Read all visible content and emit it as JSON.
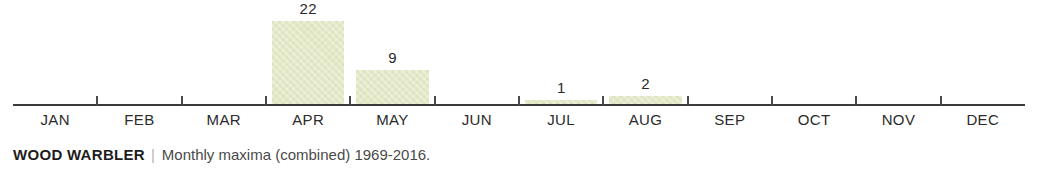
{
  "chart_data": {
    "type": "bar",
    "title": "WOOD WARBLER",
    "subtitle": "Monthly maxima (combined) 1969-2016.",
    "xlabel": "",
    "ylabel": "",
    "categories": [
      "JAN",
      "FEB",
      "MAR",
      "APR",
      "MAY",
      "JUN",
      "JUL",
      "AUG",
      "SEP",
      "OCT",
      "NOV",
      "DEC"
    ],
    "values": [
      0,
      0,
      0,
      22,
      9,
      0,
      1,
      2,
      0,
      0,
      0,
      0
    ],
    "value_labels": [
      "",
      "",
      "",
      "22",
      "9",
      "",
      "1",
      "2",
      "",
      "",
      "",
      ""
    ],
    "ylim": [
      0,
      22
    ],
    "grid": false,
    "legend": false,
    "bar_color": "#dfe5c0",
    "axis_color": "#3b3b3b",
    "label_color": "#2b2b2b"
  },
  "caption": {
    "species": "WOOD WARBLER",
    "separator": "|",
    "description": "Monthly maxima (combined) 1969-2016."
  }
}
